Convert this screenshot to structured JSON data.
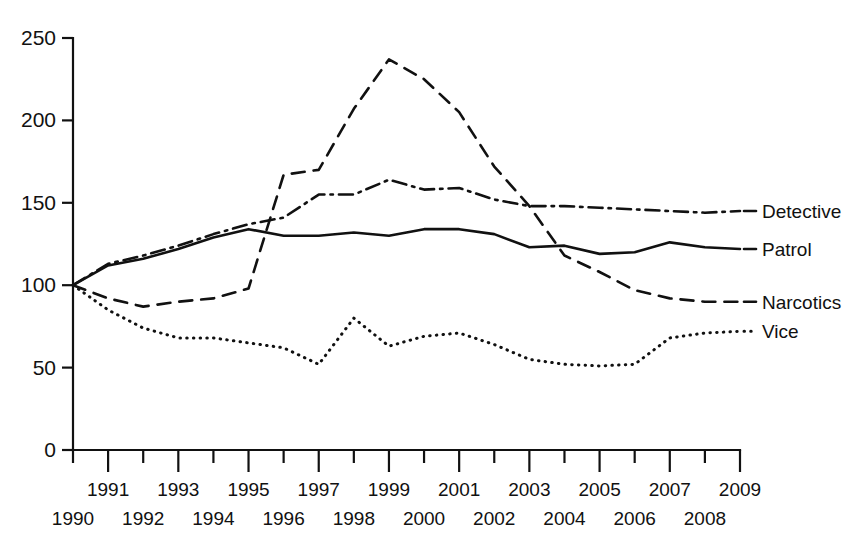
{
  "chart_data": {
    "type": "line",
    "title": "",
    "subtitle": "",
    "xlabel": "",
    "ylabel": "",
    "x": [
      1990,
      1991,
      1992,
      1993,
      1994,
      1995,
      1996,
      1997,
      1998,
      1999,
      2000,
      2001,
      2002,
      2003,
      2004,
      2005,
      2006,
      2007,
      2008,
      2009
    ],
    "xtick_labels_upper": [
      "1991",
      "1993",
      "1995",
      "1997",
      "1999",
      "2001",
      "2003",
      "2005",
      "2007",
      "2009"
    ],
    "xtick_labels_lower": [
      "1990",
      "1992",
      "1994",
      "1996",
      "1998",
      "2000",
      "2002",
      "2004",
      "2006",
      "2008"
    ],
    "ytick_labels": [
      "0",
      "50",
      "100",
      "150",
      "200",
      "250"
    ],
    "ytick_values": [
      0,
      50,
      100,
      150,
      200,
      250
    ],
    "xlim": [
      1990,
      2009
    ],
    "ylim": [
      0,
      250
    ],
    "grid": false,
    "legend_position": "right-inline",
    "series": [
      {
        "name": "Detective",
        "style": "dash-dot",
        "color": "#111111",
        "values": [
          100,
          113,
          118,
          124,
          131,
          137,
          141,
          155,
          155,
          164,
          158,
          159,
          152,
          148,
          148,
          147,
          146,
          145,
          144,
          145
        ]
      },
      {
        "name": "Patrol",
        "style": "solid",
        "color": "#111111",
        "values": [
          100,
          112,
          116,
          122,
          129,
          134,
          130,
          130,
          132,
          130,
          134,
          134,
          131,
          123,
          124,
          119,
          120,
          126,
          123,
          122
        ]
      },
      {
        "name": "Narcotics",
        "style": "dashed",
        "color": "#111111",
        "values": [
          100,
          92,
          87,
          90,
          92,
          98,
          167,
          170,
          207,
          237,
          225,
          205,
          172,
          148,
          118,
          108,
          97,
          92,
          90,
          90
        ]
      },
      {
        "name": "Vice",
        "style": "dotted",
        "color": "#111111",
        "values": [
          100,
          85,
          74,
          68,
          68,
          65,
          62,
          52,
          80,
          63,
          69,
          71,
          64,
          55,
          52,
          51,
          52,
          68,
          71,
          72
        ]
      }
    ]
  },
  "legend": {
    "items": [
      {
        "label": "Detective",
        "style": "dash-dot"
      },
      {
        "label": "Patrol",
        "style": "solid"
      },
      {
        "label": "Narcotics",
        "style": "dashed"
      },
      {
        "label": "Vice",
        "style": "dotted"
      }
    ]
  }
}
